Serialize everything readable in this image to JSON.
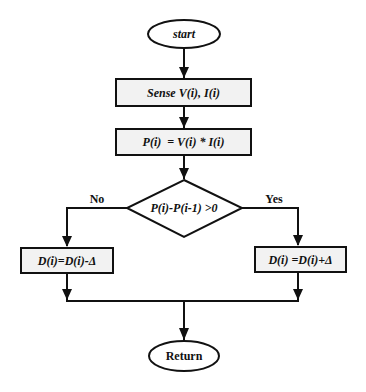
{
  "flowchart": {
    "start": "start",
    "sense": "Sense V(i), I(i)",
    "power": "P(i)  = V(i) * I(i)",
    "decision": "P(i)-P(i-1) >0",
    "no_label": "No",
    "yes_label": "Yes",
    "decrease": "D(i)=D(i)-Δ",
    "increase": "D(i) =D(i)+Δ",
    "end": "Return"
  },
  "colors": {
    "stroke": "#111111",
    "box_fill": "#f2f2f2",
    "terminal_fill": "#ffffff"
  }
}
